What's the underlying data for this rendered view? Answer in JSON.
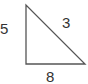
{
  "diagram": {
    "shape": "right-triangle",
    "labels": {
      "left_side": "5",
      "hypotenuse": "3",
      "base": "8"
    },
    "stroke_color": "#555555"
  }
}
